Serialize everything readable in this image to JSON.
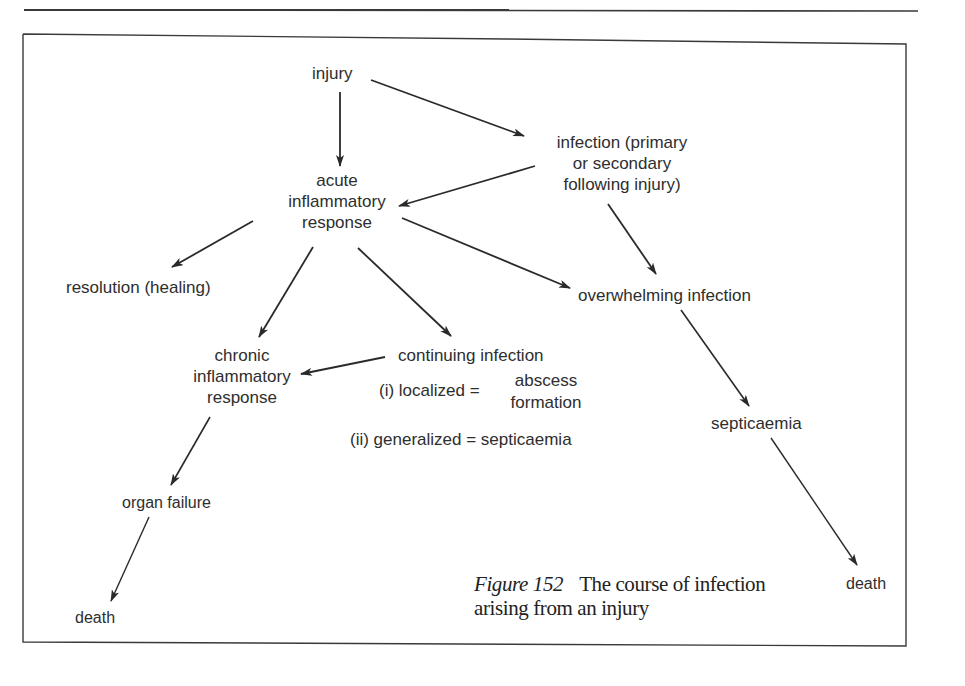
{
  "figure": {
    "number_label": "Figure 152",
    "caption_line1": "The course of infection",
    "caption_line2": "arising from an injury"
  },
  "nodes": {
    "injury": "injury",
    "infection": [
      "infection (primary",
      "or secondary",
      "following injury)"
    ],
    "acute": [
      "acute",
      "inflammatory",
      "response"
    ],
    "resolution": "resolution (healing)",
    "overwhelming": "overwhelming infection",
    "chronic": [
      "chronic",
      "inflammatory",
      "response"
    ],
    "continuing": "continuing infection",
    "localized": "(i) localized =",
    "abscess": [
      "abscess",
      "formation"
    ],
    "generalized": "(ii) generalized = septicaemia",
    "septicaemia": "septicaemia",
    "organ_failure": "organ failure",
    "death_left": "death",
    "death_right": "death"
  },
  "edges": [
    {
      "from": "injury",
      "to": "acute inflammatory response"
    },
    {
      "from": "injury",
      "to": "infection (primary or secondary following injury)"
    },
    {
      "from": "infection (primary or secondary following injury)",
      "to": "acute inflammatory response"
    },
    {
      "from": "infection (primary or secondary following injury)",
      "to": "overwhelming infection"
    },
    {
      "from": "acute inflammatory response",
      "to": "resolution (healing)"
    },
    {
      "from": "acute inflammatory response",
      "to": "chronic inflammatory response"
    },
    {
      "from": "acute inflammatory response",
      "to": "continuing infection"
    },
    {
      "from": "acute inflammatory response",
      "to": "overwhelming infection"
    },
    {
      "from": "continuing infection",
      "to": "chronic inflammatory response"
    },
    {
      "from": "overwhelming infection",
      "to": "septicaemia"
    },
    {
      "from": "septicaemia",
      "to": "death"
    },
    {
      "from": "chronic inflammatory response",
      "to": "organ failure"
    },
    {
      "from": "organ failure",
      "to": "death"
    }
  ]
}
